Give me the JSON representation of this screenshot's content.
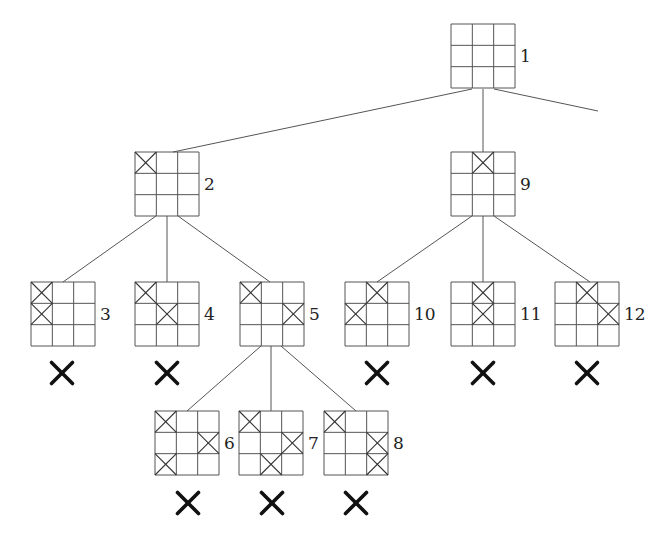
{
  "diagram": {
    "type": "game-tree",
    "board_size": 64,
    "grid": 3,
    "colors": {
      "line": "#555555",
      "cross": "#333333",
      "prune": "#111111",
      "background": "#ffffff"
    },
    "nodes": [
      {
        "id": 1,
        "label": "1",
        "x": 451,
        "y": 24,
        "marks": [],
        "pruned": false
      },
      {
        "id": 2,
        "label": "2",
        "x": 135,
        "y": 152,
        "marks": [
          [
            0,
            0
          ]
        ],
        "pruned": false
      },
      {
        "id": 3,
        "label": "3",
        "x": 31,
        "y": 282,
        "marks": [
          [
            0,
            0
          ],
          [
            1,
            0
          ]
        ],
        "pruned": true
      },
      {
        "id": 4,
        "label": "4",
        "x": 135,
        "y": 282,
        "marks": [
          [
            0,
            0
          ],
          [
            1,
            1
          ]
        ],
        "pruned": true
      },
      {
        "id": 5,
        "label": "5",
        "x": 240,
        "y": 282,
        "marks": [
          [
            0,
            0
          ],
          [
            1,
            2
          ]
        ],
        "pruned": false
      },
      {
        "id": 6,
        "label": "6",
        "x": 155,
        "y": 411,
        "marks": [
          [
            0,
            0
          ],
          [
            1,
            2
          ],
          [
            2,
            0
          ]
        ],
        "pruned": true
      },
      {
        "id": 7,
        "label": "7",
        "x": 239,
        "y": 411,
        "marks": [
          [
            0,
            0
          ],
          [
            1,
            2
          ],
          [
            2,
            1
          ]
        ],
        "pruned": true
      },
      {
        "id": 8,
        "label": "8",
        "x": 324,
        "y": 411,
        "marks": [
          [
            0,
            0
          ],
          [
            1,
            2
          ],
          [
            2,
            2
          ]
        ],
        "pruned": true
      },
      {
        "id": 9,
        "label": "9",
        "x": 451,
        "y": 152,
        "marks": [
          [
            0,
            1
          ]
        ],
        "pruned": false
      },
      {
        "id": 10,
        "label": "10",
        "x": 345,
        "y": 282,
        "marks": [
          [
            0,
            1
          ],
          [
            1,
            0
          ]
        ],
        "pruned": true
      },
      {
        "id": 11,
        "label": "11",
        "x": 451,
        "y": 282,
        "marks": [
          [
            0,
            1
          ],
          [
            1,
            1
          ]
        ],
        "pruned": true
      },
      {
        "id": 12,
        "label": "12",
        "x": 555,
        "y": 282,
        "marks": [
          [
            0,
            1
          ],
          [
            1,
            2
          ]
        ],
        "pruned": true
      }
    ],
    "edges": [
      {
        "from": 1,
        "to": 2,
        "x1": 472,
        "y1": 89,
        "x2": 173,
        "y2": 152
      },
      {
        "from": 1,
        "to": 9,
        "x1": 483,
        "y1": 89,
        "x2": 483,
        "y2": 152
      },
      {
        "from": 1,
        "to": "offscreen",
        "x1": 494,
        "y1": 89,
        "x2": 598,
        "y2": 111
      },
      {
        "from": 2,
        "to": 3,
        "x1": 156,
        "y1": 216,
        "x2": 63,
        "y2": 282
      },
      {
        "from": 2,
        "to": 4,
        "x1": 167,
        "y1": 216,
        "x2": 167,
        "y2": 282
      },
      {
        "from": 2,
        "to": 5,
        "x1": 178,
        "y1": 216,
        "x2": 270,
        "y2": 282
      },
      {
        "from": 5,
        "to": 6,
        "x1": 261,
        "y1": 346,
        "x2": 187,
        "y2": 411
      },
      {
        "from": 5,
        "to": 7,
        "x1": 271,
        "y1": 346,
        "x2": 271,
        "y2": 411
      },
      {
        "from": 5,
        "to": 8,
        "x1": 281,
        "y1": 346,
        "x2": 356,
        "y2": 411
      },
      {
        "from": 9,
        "to": 10,
        "x1": 472,
        "y1": 216,
        "x2": 377,
        "y2": 282
      },
      {
        "from": 9,
        "to": 11,
        "x1": 483,
        "y1": 216,
        "x2": 483,
        "y2": 282
      },
      {
        "from": 9,
        "to": 12,
        "x1": 494,
        "y1": 216,
        "x2": 590,
        "y2": 282
      }
    ],
    "prune_marks": [
      {
        "node": 3,
        "cx": 62,
        "cy": 373
      },
      {
        "node": 4,
        "cx": 167,
        "cy": 373
      },
      {
        "node": 10,
        "cx": 377,
        "cy": 373
      },
      {
        "node": 11,
        "cx": 483,
        "cy": 373
      },
      {
        "node": 12,
        "cx": 587,
        "cy": 373
      },
      {
        "node": 6,
        "cx": 188,
        "cy": 503
      },
      {
        "node": 7,
        "cx": 272,
        "cy": 503
      },
      {
        "node": 8,
        "cx": 356,
        "cy": 503
      }
    ]
  }
}
